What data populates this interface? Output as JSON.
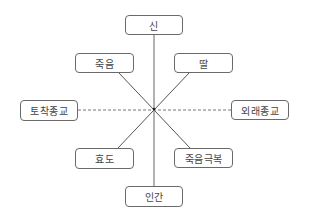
{
  "diagram": {
    "type": "radial-axis-diagram",
    "center": {
      "x": 154,
      "y": 109
    },
    "nodes": [
      {
        "id": "top",
        "label": "신",
        "x": 125,
        "y": 15,
        "w": 58,
        "h": 20
      },
      {
        "id": "upper-left",
        "label": "죽음",
        "x": 75,
        "y": 53,
        "w": 59,
        "h": 20
      },
      {
        "id": "upper-right",
        "label": "딸",
        "x": 174,
        "y": 53,
        "w": 59,
        "h": 20
      },
      {
        "id": "left",
        "label": "토착종교",
        "x": 20,
        "y": 100,
        "w": 58,
        "h": 21
      },
      {
        "id": "right",
        "label": "외래종교",
        "x": 231,
        "y": 100,
        "w": 58,
        "h": 20
      },
      {
        "id": "lower-left",
        "label": "효도",
        "x": 75,
        "y": 148,
        "w": 59,
        "h": 21
      },
      {
        "id": "lower-right",
        "label": "죽음극복",
        "x": 174,
        "y": 148,
        "w": 59,
        "h": 20
      },
      {
        "id": "bottom",
        "label": "인간",
        "x": 125,
        "y": 186,
        "w": 58,
        "h": 21
      }
    ],
    "edges": [
      {
        "from": "top",
        "to": "bottom",
        "style": "solid",
        "color": "#555555"
      },
      {
        "from": "upper-left",
        "to": "lower-right",
        "style": "solid",
        "color": "#555555"
      },
      {
        "from": "upper-right",
        "to": "lower-left",
        "style": "solid",
        "color": "#555555"
      },
      {
        "from": "left",
        "to": "right",
        "style": "dashed",
        "color": "#777777"
      }
    ]
  }
}
